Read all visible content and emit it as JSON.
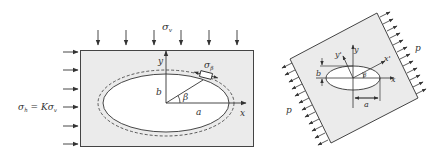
{
  "left_panel": {
    "name": "Elliptical opening under biaxial stress",
    "vertical_stress_label": "σ",
    "vertical_stress_sub": "v",
    "horizontal_stress_label": "σ",
    "horizontal_stress_sub": "h",
    "horizontal_stress_eq": " = Kσ",
    "horizontal_stress_eq_sub": "v",
    "tangential_stress_label": "σ",
    "tangential_stress_sub": "β",
    "axis_x": "x",
    "axis_y": "y",
    "semi_axis_a": "a",
    "semi_axis_b": "b",
    "angle": "β",
    "top_arrow_count": 6,
    "left_arrow_count": 6
  },
  "right_panel": {
    "name": "Rotated plate with elliptical hole under uniaxial tension",
    "load_label_right": "p",
    "load_label_left": "p",
    "axis_x": "x",
    "axis_y": "y",
    "axis_x_prime": "x'",
    "axis_y_prime": "y'",
    "semi_axis_a": "a",
    "semi_axis_b": "b",
    "angle": "β"
  },
  "colors": {
    "plate_fill": "#ebebeb",
    "stroke": "#333333"
  }
}
